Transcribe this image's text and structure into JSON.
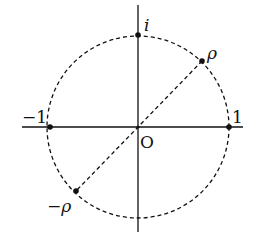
{
  "diagram": {
    "type": "unit-circle-complex-plane",
    "labels": {
      "origin": "O",
      "imag_unit": "i",
      "real_pos": "1",
      "real_neg": "−1",
      "rho": "ρ",
      "neg_rho": "−ρ"
    },
    "points": [
      {
        "name": "i",
        "x": 0,
        "y": 1
      },
      {
        "name": "1",
        "x": 1,
        "y": 0
      },
      {
        "name": "-1",
        "x": -1,
        "y": 0
      },
      {
        "name": "rho",
        "angle_deg": 45
      },
      {
        "name": "-rho",
        "angle_deg": 225
      }
    ],
    "colors": {
      "ink": "#111111",
      "background": "#ffffff"
    }
  }
}
